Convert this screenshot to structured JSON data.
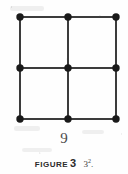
{
  "figure": {
    "count_label": "9",
    "caption": {
      "word": "FIGURE",
      "number": "3",
      "expression_base": "3",
      "expression_exponent": "2",
      "expression_punctuation": "."
    },
    "diagram": {
      "type": "square-lattice-dot-grid",
      "rows": 3,
      "columns": 3,
      "total_dots": 9,
      "cells": 4,
      "dot_color": "#1a1a1a",
      "line_color": "#3c3c3c",
      "dot_radius": 3.6,
      "line_width": 2,
      "x_positions": [
        20,
        68,
        116
      ],
      "y_positions": [
        17,
        68,
        119
      ],
      "nodes": [
        {
          "id": "n-0-0",
          "name": "dot-top-left",
          "cx": 20,
          "cy": 17
        },
        {
          "id": "n-0-1",
          "name": "dot-top-center",
          "cx": 68,
          "cy": 17
        },
        {
          "id": "n-0-2",
          "name": "dot-top-right",
          "cx": 116,
          "cy": 17
        },
        {
          "id": "n-1-0",
          "name": "dot-middle-left",
          "cx": 20,
          "cy": 68
        },
        {
          "id": "n-1-1",
          "name": "dot-middle-center",
          "cx": 68,
          "cy": 68
        },
        {
          "id": "n-1-2",
          "name": "dot-middle-right",
          "cx": 116,
          "cy": 68
        },
        {
          "id": "n-2-0",
          "name": "dot-bottom-left",
          "cx": 20,
          "cy": 119
        },
        {
          "id": "n-2-1",
          "name": "dot-bottom-center",
          "cx": 68,
          "cy": 119
        },
        {
          "id": "n-2-2",
          "name": "dot-bottom-right",
          "cx": 116,
          "cy": 119
        }
      ],
      "horizontal_lines": [
        {
          "name": "grid-line-row-top",
          "x1": 20,
          "y1": 17,
          "x2": 116,
          "y2": 17
        },
        {
          "name": "grid-line-row-middle",
          "x1": 20,
          "y1": 68,
          "x2": 116,
          "y2": 68
        },
        {
          "name": "grid-line-row-bottom",
          "x1": 20,
          "y1": 119,
          "x2": 116,
          "y2": 119
        }
      ],
      "vertical_lines": [
        {
          "name": "grid-line-col-left",
          "x1": 20,
          "y1": 17,
          "x2": 20,
          "y2": 119
        },
        {
          "name": "grid-line-col-center",
          "x1": 68,
          "y1": 17,
          "x2": 68,
          "y2": 119
        },
        {
          "name": "grid-line-col-right",
          "x1": 116,
          "y1": 17,
          "x2": 116,
          "y2": 119
        }
      ]
    }
  }
}
